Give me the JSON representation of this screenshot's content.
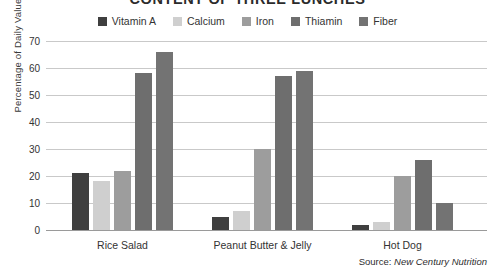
{
  "chart_data": {
    "type": "bar",
    "title": "CONTENT OF THREE LUNCHES",
    "xlabel": "",
    "ylabel": "Percentage of Daily Value",
    "ylim": [
      0,
      70
    ],
    "yticks": [
      0,
      10,
      20,
      30,
      40,
      50,
      60,
      70
    ],
    "grid": true,
    "legend_position": "top",
    "categories": [
      "Rice Salad",
      "Peanut Butter & Jelly",
      "Hot Dog"
    ],
    "series": [
      {
        "name": "Vitamin A",
        "color": "#3f3f3f",
        "values": [
          21,
          5,
          2
        ]
      },
      {
        "name": "Calcium",
        "color": "#cfcfcf",
        "values": [
          18,
          7,
          3
        ]
      },
      {
        "name": "Iron",
        "color": "#9d9d9d",
        "values": [
          22,
          30,
          20
        ]
      },
      {
        "name": "Thiamin",
        "color": "#6e6e6e",
        "values": [
          58,
          57,
          26
        ]
      },
      {
        "name": "Fiber",
        "color": "#737373",
        "values": [
          66,
          59,
          10
        ]
      }
    ],
    "source_label": "Source:",
    "source_name": "New Century Nutrition"
  }
}
